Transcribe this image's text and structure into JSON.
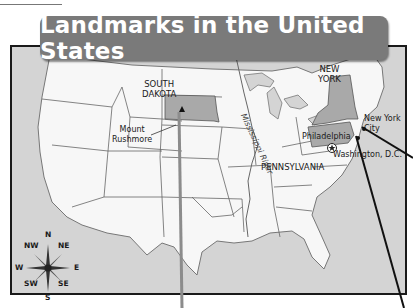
{
  "title": "Landmarks in the United States",
  "map": {
    "states": [
      {
        "name": "SOUTH DAKOTA",
        "lines": [
          "SOUTH",
          "DAKOTA"
        ],
        "highlighted": true
      },
      {
        "name": "NEW YORK",
        "lines": [
          "NEW",
          "YORK"
        ],
        "highlighted": true
      },
      {
        "name": "PENNSYLVANIA",
        "lines": [
          "PENNSYLVANIA"
        ],
        "highlighted": true
      }
    ],
    "landmarks": [
      {
        "name": "Mount Rushmore",
        "lines": [
          "Mount",
          "Rushmore"
        ],
        "marker": "triangle-icon"
      },
      {
        "name": "New York City",
        "lines": [
          "New York",
          "City"
        ],
        "marker": "dot-icon"
      },
      {
        "name": "Philadelphia",
        "lines": [
          "Philadelphia"
        ],
        "marker": "dot-icon"
      },
      {
        "name": "Washington, D.C.",
        "lines": [
          "Washington, D.C."
        ],
        "marker": "star-in-circle-icon"
      }
    ],
    "river": "Mississippi River",
    "compass": {
      "N": "N",
      "NE": "NE",
      "E": "E",
      "SE": "SE",
      "S": "S",
      "SW": "SW",
      "W": "W",
      "NW": "NW"
    },
    "colors": {
      "land": "#f7f7f7",
      "water": "#d4d4d4",
      "highlight": "#a9a9a9",
      "border": "#555555",
      "banner": "#7a7a7a",
      "frame": "#1a1a1a"
    }
  }
}
